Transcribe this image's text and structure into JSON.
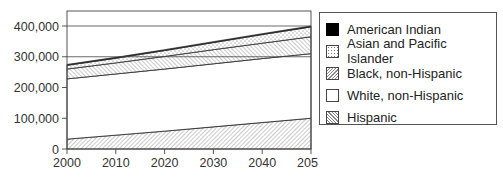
{
  "chart_data": {
    "type": "area",
    "stacked": true,
    "title": "",
    "xlabel": "",
    "ylabel": "",
    "x": [
      2000,
      2010,
      2020,
      2030,
      2040,
      2050
    ],
    "xticks": [
      "2000",
      "2010",
      "2020",
      "2030",
      "2040",
      "2050"
    ],
    "yticks": [
      "0",
      "100,000",
      "200,000",
      "300,000",
      "400,000"
    ],
    "ylim": [
      0,
      400000
    ],
    "xlim": [
      2000,
      2050
    ],
    "grid": "horizontal gridlines at 300,000 and 400,000",
    "legend_position": "right",
    "series": [
      {
        "name": "Hispanic",
        "pattern": "back-hatch",
        "values": [
          32000,
          45000,
          58000,
          72000,
          86000,
          100000
        ]
      },
      {
        "name": "White, non-Hispanic",
        "pattern": "white",
        "values": [
          196000,
          199000,
          202000,
          205000,
          208000,
          210000
        ]
      },
      {
        "name": "Black, non-Hispanic",
        "pattern": "forward-hatch",
        "values": [
          32000,
          36000,
          41000,
          46000,
          50000,
          55000
        ]
      },
      {
        "name": "Asian and Pacific Islander",
        "pattern": "dots",
        "values": [
          12000,
          15000,
          19000,
          23000,
          28000,
          32000
        ]
      },
      {
        "name": "American Indian",
        "pattern": "solid-black",
        "values": [
          3000,
          3000,
          3000,
          3000,
          3000,
          3000
        ]
      }
    ]
  },
  "legend": {
    "items": [
      {
        "label": "American Indian"
      },
      {
        "label": "Asian and Pacific Islander"
      },
      {
        "label": "Black, non-Hispanic"
      },
      {
        "label": "White, non-Hispanic"
      },
      {
        "label": "Hispanic"
      }
    ]
  }
}
